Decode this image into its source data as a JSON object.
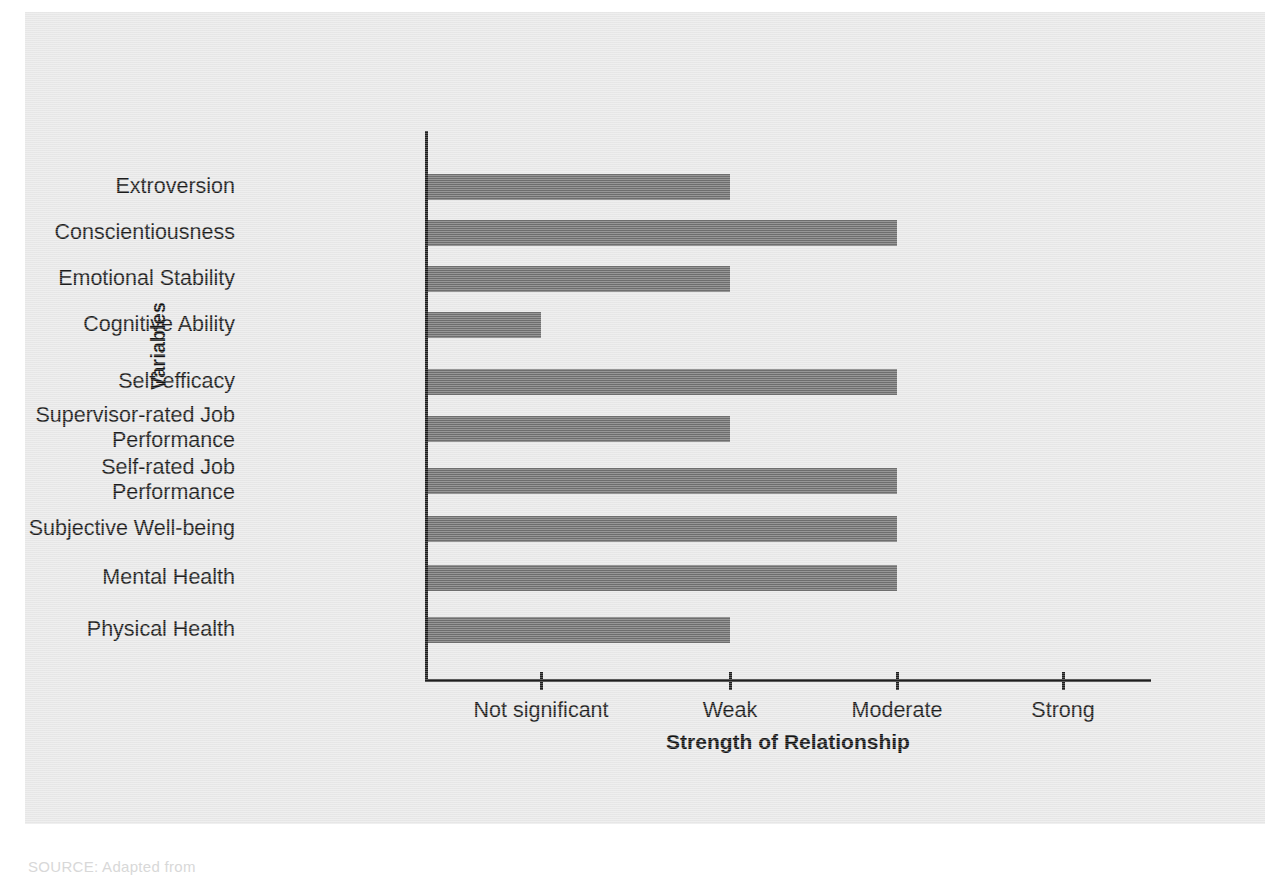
{
  "chart_data": {
    "type": "bar",
    "orientation": "horizontal",
    "title": "",
    "xlabel": "Strength of Relationship",
    "ylabel": "Variables",
    "categories": [
      "Extroversion",
      "Conscientiousness",
      "Emotional Stability",
      "Cognitive Ability",
      "Self-efficacy",
      "Supervisor-rated Job\nPerformance",
      "Self-rated Job\nPerformance",
      "Subjective Well-being",
      "Mental Health",
      "Physical Health"
    ],
    "x_tick_labels": [
      "Not significant",
      "Weak",
      "Moderate",
      "Strong"
    ],
    "x_tick_values": [
      1,
      2,
      3,
      4
    ],
    "xlim": [
      0.33,
      4.4
    ],
    "values": [
      2,
      3,
      2,
      1,
      3,
      2,
      3,
      3,
      3,
      2
    ],
    "value_labels": [
      "Weak",
      "Moderate",
      "Weak",
      "Not significant",
      "Moderate",
      "Weak",
      "Moderate",
      "Moderate",
      "Moderate",
      "Weak"
    ],
    "grid": false,
    "legend": false,
    "bar_color": "#6f6f6f",
    "axis_color": "#1d1d1d",
    "background_color": "#e9e9e9"
  },
  "figure": {
    "source_note": "SOURCE: Adapted from"
  }
}
